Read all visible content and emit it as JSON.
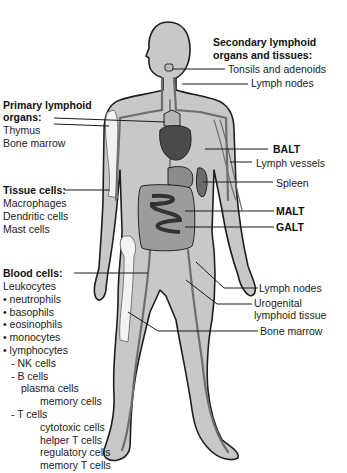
{
  "colors": {
    "body_fill": "#c8c8c8",
    "outline": "#1e1e1e",
    "vessel": "#6e6e6e",
    "organ_dark": "#4a4a4a",
    "organ_mid": "#8c8c8c",
    "bone": "#f2f2f2"
  },
  "left_labels": {
    "primary": {
      "heading_line1": "Primary lymphoid",
      "heading_line2": "organs:",
      "items": [
        "Thymus",
        "Bone marrow"
      ]
    },
    "tissue": {
      "heading": "Tissue cells:",
      "items": [
        "Macrophages",
        "Dendritic cells",
        "Mast cells"
      ]
    },
    "blood": {
      "heading": "Blood cells:",
      "leukocytes": "Leukocytes",
      "items": [
        "• neutrophils",
        "• basophils",
        "• eosinophils",
        "• monocytes",
        "• lymphocytes"
      ],
      "lymphocytes": {
        "nk": "- NK cells",
        "b": "- B cells",
        "b_sub": [
          "plasma cells",
          "memory cells"
        ],
        "t": "- T cells",
        "t_sub": [
          "cytotoxic cells",
          "helper T cells",
          "regulatory cells",
          "memory T cells"
        ]
      }
    }
  },
  "right_labels": {
    "secondary_heading_line1": "Secondary lymphoid",
    "secondary_heading_line2": "organs and tissues:",
    "tonsils": "Tonsils and adenoids",
    "lymph_nodes_top": "Lymph nodes",
    "balt": "BALT",
    "lymph_vessels": "Lymph vessels",
    "spleen": "Spleen",
    "malt": "MALT",
    "galt": "GALT",
    "lymph_nodes_bottom": "Lymph nodes",
    "urogenital_line1": "Urogenital",
    "urogenital_line2": "lymphoid tissue",
    "bone_marrow": "Bone marrow"
  }
}
